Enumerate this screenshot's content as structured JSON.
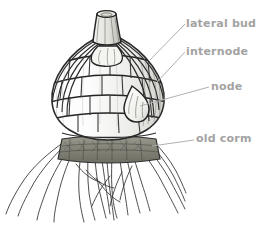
{
  "figure": {
    "name": "corm-structure-diagram",
    "subject": "corm",
    "background_color": "#ffffff",
    "ink_color": "#333333",
    "label_color": "#a3a3a3",
    "leader_color": "#b0b0b0",
    "shade_color": "#7a7a72"
  },
  "labels": [
    {
      "id": "lateral-bud",
      "text": "lateral bud"
    },
    {
      "id": "internode",
      "text": "internode"
    },
    {
      "id": "node",
      "text": "node"
    },
    {
      "id": "old-corm",
      "text": "old corm"
    }
  ],
  "parts": {
    "stem_stub": "cut stem stub at apex",
    "tunic_ridges": "vertical papery tunic ridges",
    "node_bands": "horizontal node bands",
    "lateral_bud": "teardrop lateral bud on corm flank",
    "old_corm": "shrivelled old corm slab at base",
    "roots": "fibrous adventitious roots"
  }
}
